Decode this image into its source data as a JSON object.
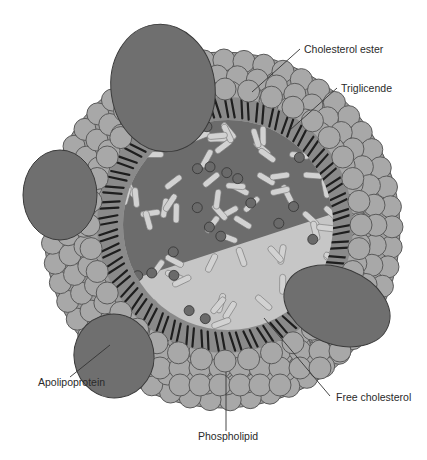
{
  "diagram": {
    "labels": {
      "cholesterol_ester": "Cholesterol ester",
      "triglyceride": "Triglicende",
      "apolipoprotein": "Apolipoprotein",
      "free_cholesterol": "Free cholesterol",
      "phospholipid": "Phospholipid"
    },
    "colors": {
      "background": "#ffffff",
      "phospholipid_head": "#a6a6a6",
      "phospholipid_stroke": "#555555",
      "apolipoprotein": "#6f6f6f",
      "core_dark": "#6a6a6a",
      "core_light": "#c4c4c4",
      "tail": "#222222",
      "ester_rod": "#d0d0d0",
      "leader_line": "#333333"
    }
  }
}
